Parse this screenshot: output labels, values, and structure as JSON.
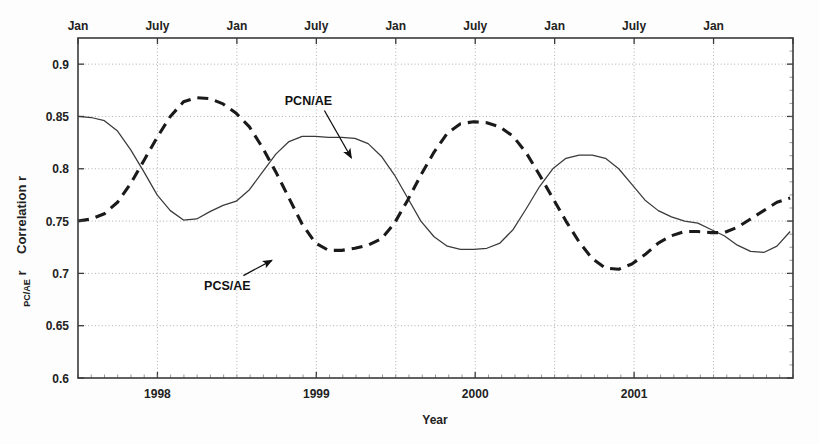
{
  "chart_data": {
    "type": "line",
    "title": "",
    "xlabel": "Year",
    "ylabel": "Correlation r",
    "ylabel_subscript": "PC/AE",
    "ylim": [
      0.6,
      0.925
    ],
    "yticks": [
      0.6,
      0.65,
      0.7,
      0.75,
      0.8,
      0.85,
      0.9
    ],
    "ytick_labels": [
      "0.6",
      "0.65",
      "0.7",
      "0.75",
      "0.8",
      "0.85",
      "0.9"
    ],
    "xlim": [
      1997.5,
      2002.0
    ],
    "x_major_ticks": [
      1998,
      1999,
      2000,
      2001
    ],
    "x_major_labels": [
      "1998",
      "1999",
      "2000",
      "2001"
    ],
    "x_top_ticks": [
      1997.5,
      1998.0,
      1998.5,
      1999.0,
      1999.5,
      2000.0,
      2000.5,
      2001.0,
      2001.5,
      2002.0
    ],
    "x_top_labels": [
      "Jan",
      "July",
      "Jan",
      "July",
      "Jan",
      "July",
      "Jan",
      "July",
      "Jan"
    ],
    "grid": true,
    "legend_position": "inline-annotations",
    "annotations": [
      {
        "label": "PCN/AE",
        "text_x": 1998.95,
        "text_y": 0.8605,
        "arrow_to_x": 1999.22,
        "arrow_to_y": 0.8105
      },
      {
        "label": "PCS/AE",
        "text_x": 1998.44,
        "text_y": 0.6845,
        "arrow_to_x": 1998.72,
        "arrow_to_y": 0.7125
      }
    ],
    "series": [
      {
        "name": "PCN/AE",
        "style": "solid",
        "color": "#3a3a3a",
        "x": [
          1997.5,
          1997.583,
          1997.667,
          1997.75,
          1997.833,
          1997.917,
          1998.0,
          1998.083,
          1998.167,
          1998.25,
          1998.333,
          1998.417,
          1998.5,
          1998.583,
          1998.667,
          1998.75,
          1998.833,
          1998.917,
          1999.0,
          1999.083,
          1999.167,
          1999.25,
          1999.333,
          1999.417,
          1999.5,
          1999.583,
          1999.667,
          1999.75,
          1999.833,
          1999.917,
          2000.0,
          2000.083,
          2000.167,
          2000.25,
          2000.333,
          2000.417,
          2000.5,
          2000.583,
          2000.667,
          2000.75,
          2000.833,
          2000.917,
          2001.0,
          2001.083,
          2001.167,
          2001.25,
          2001.333,
          2001.417,
          2001.5,
          2001.583,
          2001.667,
          2001.75,
          2001.833,
          2001.917,
          2002.0
        ],
        "y": [
          0.85,
          0.849,
          0.846,
          0.836,
          0.818,
          0.797,
          0.775,
          0.76,
          0.751,
          0.752,
          0.759,
          0.765,
          0.769,
          0.78,
          0.797,
          0.814,
          0.826,
          0.831,
          0.831,
          0.83,
          0.83,
          0.829,
          0.824,
          0.812,
          0.794,
          0.772,
          0.75,
          0.735,
          0.726,
          0.723,
          0.723,
          0.724,
          0.729,
          0.742,
          0.762,
          0.783,
          0.8,
          0.81,
          0.813,
          0.813,
          0.81,
          0.8,
          0.785,
          0.77,
          0.76,
          0.754,
          0.75,
          0.748,
          0.742,
          0.736,
          0.727,
          0.721,
          0.72,
          0.726,
          0.74
        ],
        "y_extended": [
          0.758,
          0.772,
          0.783,
          0.79,
          0.79,
          0.787,
          0.782,
          0.776,
          0.768,
          0.76,
          0.752,
          0.747,
          0.744,
          0.742,
          0.74,
          0.724,
          0.725,
          0.728,
          0.736,
          0.748,
          0.762,
          0.774,
          0.782,
          0.786,
          0.789
        ]
      },
      {
        "name": "PCS/AE",
        "style": "dashed",
        "color": "#1a1a1a",
        "x": [
          1997.5,
          1997.583,
          1997.667,
          1997.75,
          1997.833,
          1997.917,
          1998.0,
          1998.083,
          1998.167,
          1998.25,
          1998.333,
          1998.417,
          1998.5,
          1998.583,
          1998.667,
          1998.75,
          1998.833,
          1998.917,
          1999.0,
          1999.083,
          1999.167,
          1999.25,
          1999.333,
          1999.417,
          1999.5,
          1999.583,
          1999.667,
          1999.75,
          1999.833,
          1999.917,
          2000.0,
          2000.083,
          2000.167,
          2000.25,
          2000.333,
          2000.417,
          2000.5,
          2000.583,
          2000.667,
          2000.75,
          2000.833,
          2000.917,
          2001.0,
          2001.083,
          2001.167,
          2001.25,
          2001.333,
          2001.417,
          2001.5,
          2001.583,
          2001.667,
          2001.75,
          2001.833,
          2001.917,
          2002.0
        ],
        "y": [
          0.75,
          0.752,
          0.757,
          0.768,
          0.786,
          0.808,
          0.83,
          0.85,
          0.864,
          0.868,
          0.867,
          0.862,
          0.853,
          0.84,
          0.82,
          0.797,
          0.772,
          0.747,
          0.729,
          0.722,
          0.722,
          0.724,
          0.727,
          0.733,
          0.748,
          0.77,
          0.794,
          0.816,
          0.834,
          0.843,
          0.845,
          0.844,
          0.84,
          0.831,
          0.815,
          0.794,
          0.772,
          0.75,
          0.73,
          0.714,
          0.705,
          0.704,
          0.709,
          0.718,
          0.729,
          0.736,
          0.74,
          0.74,
          0.739,
          0.739,
          0.744,
          0.752,
          0.76,
          0.768,
          0.772
        ],
        "y_extended": [
          0.77,
          0.766,
          0.763,
          0.766,
          0.776,
          0.788,
          0.792,
          0.785,
          0.766,
          0.74,
          0.712,
          0.686,
          0.664,
          0.65,
          0.645,
          0.652,
          0.67,
          0.694,
          0.72,
          0.748,
          0.776,
          0.8,
          0.82,
          0.833,
          0.838,
          0.838,
          0.834,
          0.826,
          0.814,
          0.8,
          0.786,
          0.778
        ]
      }
    ]
  }
}
